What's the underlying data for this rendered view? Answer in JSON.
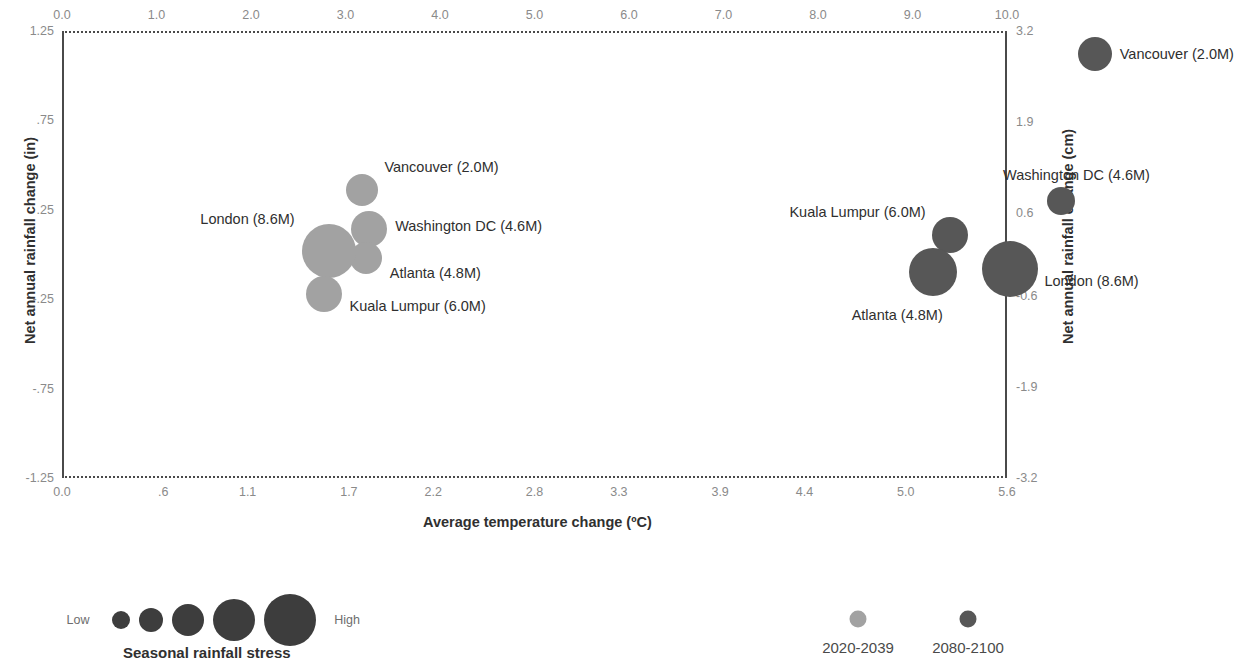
{
  "chart_data": {
    "type": "scatter",
    "title": "",
    "xlabel": "Average temperature change (ºC)",
    "ylabel": "Net annual rainfall change (in)",
    "ylabel_secondary": "Net annual rainfall change (cm)",
    "xlabel_secondary": "",
    "grid": false,
    "legend_position": "bottom",
    "x_axis_bottom": {
      "ticks": [
        "0.0",
        ".6",
        "1.1",
        "1.7",
        "2.2",
        "2.8",
        "3.3",
        "3.9",
        "4.4",
        "5.0",
        "5.6"
      ],
      "values": [
        0.0,
        0.6,
        1.1,
        1.7,
        2.2,
        2.8,
        3.3,
        3.9,
        4.4,
        5.0,
        5.6
      ],
      "range": [
        0.0,
        5.6
      ],
      "units": "ºC"
    },
    "x_axis_top": {
      "ticks": [
        "0.0",
        "1.0",
        "2.0",
        "3.0",
        "4.0",
        "5.0",
        "6.0",
        "7.0",
        "8.0",
        "9.0",
        "10.0"
      ],
      "values": [
        0,
        1,
        2,
        3,
        4,
        5,
        6,
        7,
        8,
        9,
        10
      ],
      "range": [
        0,
        10
      ],
      "units": "ºF"
    },
    "y_axis_left": {
      "ticks": [
        "1.25",
        ".75",
        ".25",
        "-.25",
        "-.75",
        "-1.25"
      ],
      "values": [
        1.25,
        0.75,
        0.25,
        -0.25,
        -0.75,
        -1.25
      ],
      "range": [
        -1.25,
        1.25
      ],
      "units": "in"
    },
    "y_axis_right": {
      "ticks": [
        "3.2",
        "1.9",
        "0.6",
        "-0.6",
        "-1.9",
        "-3.2"
      ],
      "values": [
        3.2,
        1.9,
        0.6,
        -0.6,
        -1.9,
        -3.2
      ],
      "range": [
        -3.2,
        3.2
      ],
      "units": "cm"
    },
    "series": [
      {
        "name": "2020-2039",
        "color": "#a2a2a2",
        "points": [
          {
            "label": "Vancouver (2.0M)",
            "x": 1.78,
            "y": 0.36,
            "size": 16,
            "label_side": "right",
            "label_dx": 22,
            "label_dy": -23
          },
          {
            "label": "Washington DC (4.6M)",
            "x": 1.82,
            "y": 0.14,
            "size": 18,
            "label_side": "right",
            "label_dx": 26,
            "label_dy": -3
          },
          {
            "label": "Atlanta (4.8M)",
            "x": 1.8,
            "y": -0.02,
            "size": 16,
            "label_side": "right",
            "label_dx": 24,
            "label_dy": 15
          },
          {
            "label": "London (8.6M)",
            "x": 1.58,
            "y": 0.02,
            "size": 27,
            "label_side": "left",
            "label_dx": -34,
            "label_dy": -32
          },
          {
            "label": "Kuala Lumpur (6.0M)",
            "x": 1.55,
            "y": -0.22,
            "size": 18,
            "label_side": "right",
            "label_dx": 26,
            "label_dy": 12
          }
        ]
      },
      {
        "name": "2080-2100",
        "color": "#575757",
        "points": [
          {
            "label": "Vancouver (2.0M)",
            "x": 6.12,
            "y": 1.12,
            "size": 17,
            "label_side": "right",
            "label_dx": 25,
            "label_dy": 0
          },
          {
            "label": "Washington DC (4.6M)",
            "x": 5.92,
            "y": 0.3,
            "size": 14,
            "label_side": "right",
            "label_dx": -58,
            "label_dy": -26
          },
          {
            "label": "Kuala Lumpur (6.0M)",
            "x": 5.26,
            "y": 0.11,
            "size": 18,
            "label_side": "left",
            "label_dx": -24,
            "label_dy": -23
          },
          {
            "label": "Atlanta (4.8M)",
            "x": 5.16,
            "y": -0.1,
            "size": 24,
            "label_side": "left",
            "label_dx": 10,
            "label_dy": 43
          },
          {
            "label": "London (8.6M)",
            "x": 5.62,
            "y": -0.08,
            "size": 28,
            "label_side": "right",
            "label_dx": 34,
            "label_dy": 12
          }
        ]
      }
    ],
    "size_legend": {
      "title": "Seasonal rainfall stress",
      "low_label": "Low",
      "high_label": "High",
      "color": "#3d3d3d",
      "bubble_radii": [
        9,
        12,
        16,
        21,
        26
      ]
    },
    "series_legend": [
      {
        "label": "2020-2039",
        "color": "#a2a2a2"
      },
      {
        "label": "2080-2100",
        "color": "#575757"
      }
    ]
  }
}
